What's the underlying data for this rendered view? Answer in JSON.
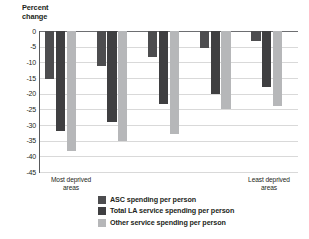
{
  "chart_data": {
    "type": "bar",
    "title": "",
    "xlabel": "",
    "ylabel": "Percent\nchange",
    "ylim": [
      -45,
      0
    ],
    "grid": true,
    "legend_position": "bottom",
    "categories": [
      "1",
      "2",
      "3",
      "4",
      "5"
    ],
    "category_end_labels": {
      "left": "Most deprived\nareas",
      "right": "Least deprived\nareas"
    },
    "ytick_labels": [
      "0",
      "-5",
      "-10",
      "-15",
      "-20",
      "-25",
      "-30",
      "-35",
      "-40",
      "-45"
    ],
    "ytick_values": [
      0,
      -5,
      -10,
      -15,
      -20,
      -25,
      -30,
      -35,
      -40,
      -45
    ],
    "series": [
      {
        "name": "ASC spending per person",
        "color": "#4d4d4f",
        "values": [
          -15.4,
          -11.2,
          -8.2,
          -5.3,
          -3.2
        ]
      },
      {
        "name": "Total LA service spending per person",
        "color": "#3f3f41",
        "values": [
          -32.0,
          -29.0,
          -23.2,
          -20.0,
          -18.0
        ]
      },
      {
        "name": "Other service spending per person",
        "color": "#b6b7b9",
        "values": [
          -38.2,
          -35.2,
          -33.0,
          -25.0,
          -23.8
        ]
      }
    ]
  }
}
